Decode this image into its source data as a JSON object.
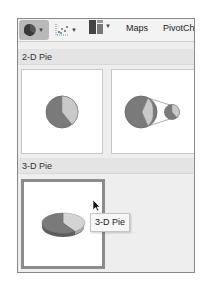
{
  "toolbar": {
    "buttons": [
      {
        "name": "pie-chart",
        "icon": "pie-chart-icon",
        "selected": true,
        "has_dropdown": true
      },
      {
        "name": "scatter-chart",
        "icon": "scatter-chart-icon",
        "selected": false,
        "has_dropdown": true
      },
      {
        "name": "hierarchy-chart",
        "icon": "hierarchy-chart-icon",
        "selected": false,
        "has_dropdown": true
      }
    ],
    "maps_label": "Maps",
    "pivotchart_label": "PivotCh"
  },
  "sections": [
    {
      "header": "2-D Pie",
      "tiles": [
        {
          "label": "Pie",
          "icon": "pie-icon"
        },
        {
          "label": "Pie of Pie",
          "icon": "pie-of-pie-icon"
        }
      ]
    },
    {
      "header": "3-D Pie",
      "tiles": [
        {
          "label": "3-D Pie",
          "icon": "3d-pie-icon",
          "hovered": true
        }
      ]
    }
  ],
  "tooltip": {
    "text": "3-D Pie"
  },
  "colors": {
    "pie_dark": "#7a7a7a",
    "pie_light": "#c9c9c9",
    "selected_button": "#b9b9b9",
    "panel_bg": "#eeeeee"
  }
}
